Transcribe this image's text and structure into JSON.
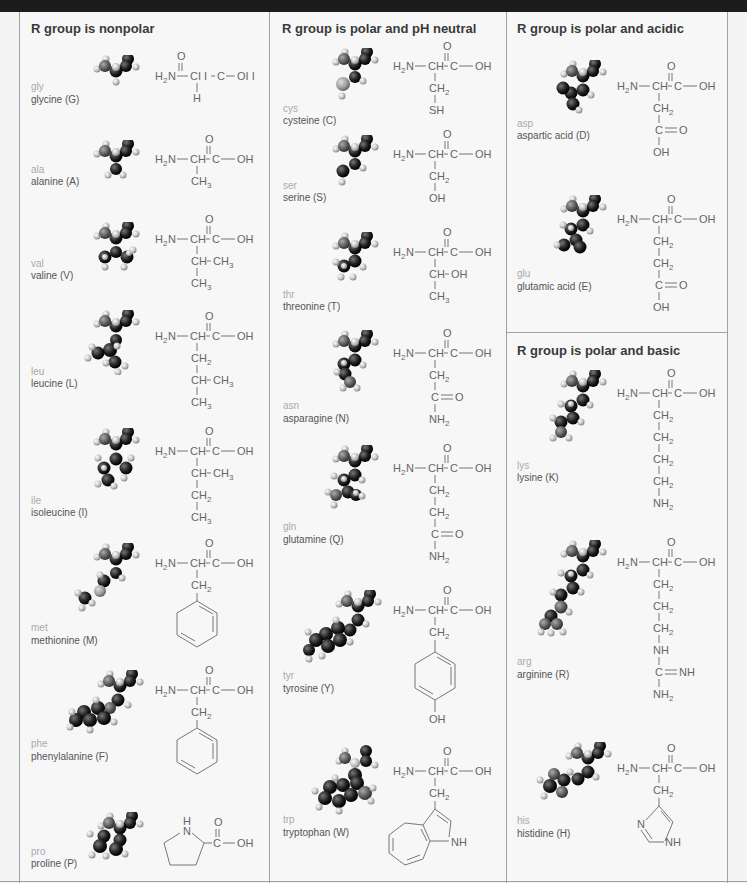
{
  "columns": [
    {
      "heading": "R group is nonpolar",
      "amino_acids": [
        {
          "abbr": "gly",
          "name": "glycine (G)",
          "backbone": "H₂N—CH–C—OH",
          "side_chain": [
            "H"
          ]
        },
        {
          "abbr": "ala",
          "name": "alanine (A)",
          "backbone": "H₂N—CH–C—OH",
          "side_chain": [
            "CH₃"
          ]
        },
        {
          "abbr": "val",
          "name": "valine (V)",
          "backbone": "H₂N—CH–C—OH",
          "side_chain": [
            "CH–CH₃",
            "CH₃"
          ]
        },
        {
          "abbr": "leu",
          "name": "leucine (L)",
          "backbone": "H₂N—CH–C—OH",
          "side_chain": [
            "CH₂",
            "CH–CH₃",
            "CH₃"
          ]
        },
        {
          "abbr": "ile",
          "name": "isoleucine (I)",
          "backbone": "H₂N—CH–C—OH",
          "side_chain": [
            "CH–CH₃",
            "CH₂",
            "CH₃"
          ]
        },
        {
          "abbr": "met",
          "name": "methionine (M)",
          "backbone": "H₂N—CH–C—OH",
          "side_chain": [
            "CH₂",
            "benzene ring"
          ]
        },
        {
          "abbr": "phe",
          "name": "phenylalanine (F)",
          "backbone": "H₂N—CH–C—OH",
          "side_chain": [
            "CH₂",
            "benzene ring"
          ]
        },
        {
          "abbr": "pro",
          "name": "proline (P)",
          "backbone": "pyrrolidine ring (N-H) –C—OH",
          "side_chain": []
        }
      ]
    },
    {
      "heading": "R group is polar and pH neutral",
      "amino_acids": [
        {
          "abbr": "cys",
          "name": "cysteine (C)",
          "backbone": "H₂N—CH–C—OH",
          "side_chain": [
            "CH₂",
            "SH"
          ]
        },
        {
          "abbr": "ser",
          "name": "serine (S)",
          "backbone": "H₂N—CH–C—OH",
          "side_chain": [
            "CH₂",
            "OH"
          ]
        },
        {
          "abbr": "thr",
          "name": "threonine (T)",
          "backbone": "H₂N—CH–C—OH",
          "side_chain": [
            "CH–OH",
            "CH₃"
          ]
        },
        {
          "abbr": "asn",
          "name": "asparagine (N)",
          "backbone": "H₂N—CH–C—OH",
          "side_chain": [
            "CH₂",
            "C=O",
            "NH₂"
          ]
        },
        {
          "abbr": "gln",
          "name": "glutamine (Q)",
          "backbone": "H₂N—CH–C—OH",
          "side_chain": [
            "CH₂",
            "CH₂",
            "C=O",
            "NH₂"
          ]
        },
        {
          "abbr": "tyr",
          "name": "tyrosine (Y)",
          "backbone": "H₂N—CH–C—OH",
          "side_chain": [
            "CH₂",
            "benzene ring",
            "OH"
          ]
        },
        {
          "abbr": "trp",
          "name": "tryptophan (W)",
          "backbone": "H₂N—CH–C—OH",
          "side_chain": [
            "CH₂",
            "indole ring",
            "NH"
          ]
        }
      ]
    },
    {
      "heading": "R group is polar and acidic",
      "amino_acids": [
        {
          "abbr": "asp",
          "name": "aspartic acid (D)",
          "backbone": "H₂N—CH–C—OH",
          "side_chain": [
            "CH₂",
            "C=O",
            "OH"
          ]
        },
        {
          "abbr": "glu",
          "name": "glutamic acid (E)",
          "backbone": "H₂N—CH–C—OH",
          "side_chain": [
            "CH₂",
            "CH₂",
            "C=O",
            "OH"
          ]
        }
      ]
    },
    {
      "heading": "R group is polar and basic",
      "amino_acids": [
        {
          "abbr": "lys",
          "name": "lysine (K)",
          "backbone": "H₂N—CH–C—OH",
          "side_chain": [
            "CH₂",
            "CH₂",
            "CH₂",
            "CH₂",
            "NH₂"
          ]
        },
        {
          "abbr": "arg",
          "name": "arginine (R)",
          "backbone": "H₂N—CH–C—OH",
          "side_chain": [
            "CH₂",
            "CH₂",
            "CH₂",
            "NH",
            "C=NH",
            "NH₂"
          ]
        },
        {
          "abbr": "his",
          "name": "histidine (H)",
          "backbone": "H₂N—CH–C—OH",
          "side_chain": [
            "CH₂",
            "imidazole ring",
            "N",
            "NH"
          ]
        }
      ]
    }
  ],
  "formula_labels": {
    "h2n": "H",
    "two": "2",
    "n": "N",
    "ch": "CH",
    "c": "C",
    "oh": "OH",
    "o": "O",
    "h": "H",
    "ch2": "CH",
    "ch3": "CH",
    "three": "3",
    "sh": "SH",
    "nh": "NH",
    "nh2": "NH",
    "gly_oh": "OI I",
    "gly_ch": "CI I"
  },
  "colors": {
    "background": "#f7f7f7",
    "border": "#a0a0a0",
    "top_strip": "#1c1c1c",
    "heading_text": "#3a3a3a",
    "abbr_text": "#aaaaaa",
    "name_text": "#555555"
  }
}
